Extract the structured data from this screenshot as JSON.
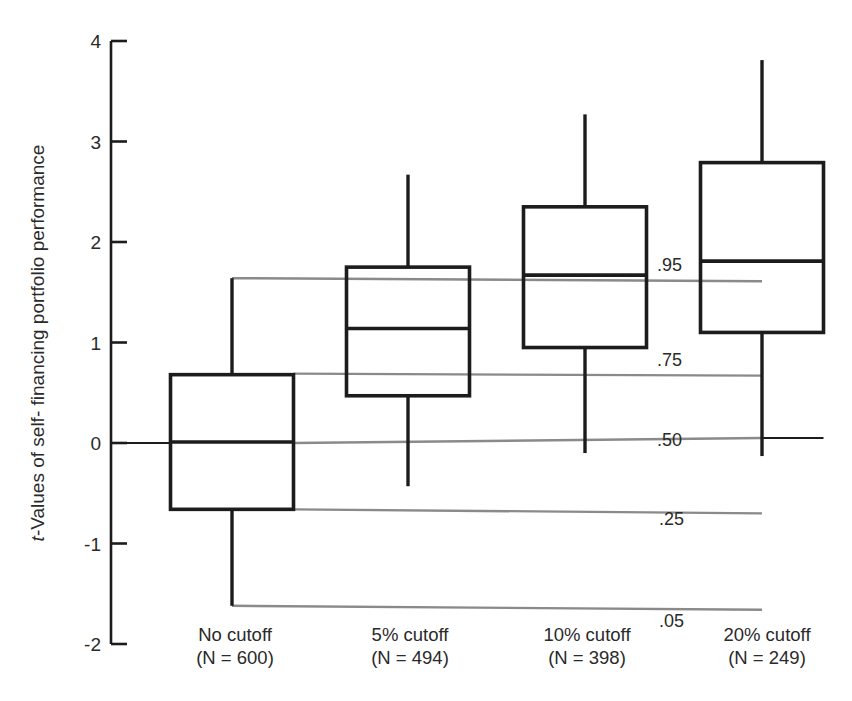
{
  "chart_data": {
    "type": "box",
    "title": "",
    "ylabel_italic": "t",
    "ylabel_rest": "-Values of self- financing portfolio performance",
    "ylabel": "t-Values of self- financing portfolio performance",
    "xlabel": "",
    "ylim": [
      -2,
      4
    ],
    "yticks": [
      4,
      3,
      2,
      1,
      0,
      -1,
      -2
    ],
    "ytick_labels": [
      "4",
      "3",
      "2",
      "1",
      "0",
      "-1",
      "-2"
    ],
    "categories": [
      {
        "name": "No cutoff",
        "n_label": "(N = 600)",
        "n": 600
      },
      {
        "name": "5% cutoff",
        "n_label": "(N = 494)",
        "n": 494
      },
      {
        "name": "10% cutoff",
        "n_label": "(N = 398)",
        "n": 398
      },
      {
        "name": "20% cutoff",
        "n_label": "(N = 249)",
        "n": 249
      }
    ],
    "boxes": [
      {
        "category": "No cutoff",
        "p05": -1.62,
        "p25": -0.66,
        "median": 0.01,
        "p75": 0.68,
        "p95": 1.64
      },
      {
        "category": "5% cutoff",
        "p05": -0.43,
        "p25": 0.47,
        "median": 1.14,
        "p75": 1.75,
        "p95": 2.67
      },
      {
        "category": "10% cutoff",
        "p05": -0.1,
        "p25": 0.95,
        "median": 1.67,
        "p75": 2.35,
        "p95": 3.27
      },
      {
        "category": "20% cutoff",
        "p05": -0.13,
        "p25": 1.1,
        "median": 1.81,
        "p75": 2.79,
        "p95": 3.81
      }
    ],
    "reference_lines": {
      "description": "Horizontal gray lines at the percentiles of the No cutoff distribution",
      "lines": [
        {
          "label": ".95",
          "value": 1.64
        },
        {
          "label": ".75",
          "value": 0.7
        },
        {
          "label": ".50",
          "value": 0.03
        },
        {
          "label": ".25",
          "value": -0.62
        },
        {
          "label": ".05",
          "value": -1.58
        }
      ]
    },
    "grid": false,
    "legend": null,
    "colors": {
      "boxes": "#1c1c1c",
      "reference_lines": "#8a8a8a"
    }
  }
}
